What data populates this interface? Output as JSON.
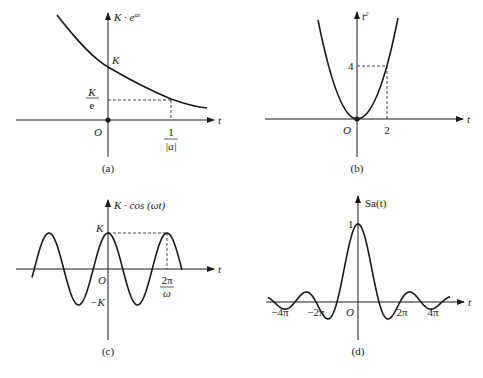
{
  "chart_data": [
    {
      "id": "a",
      "type": "line",
      "caption": "(a)",
      "ylabel": "K · e^{at}",
      "xlabel": "t",
      "function": "K·e^{at}, a<0",
      "origin_label": "O",
      "y_ticks": [
        {
          "label": "K",
          "meaning": "value at t=0"
        },
        {
          "label": "K/e",
          "meaning": "value at t=1/|a|"
        }
      ],
      "x_ticks": [
        {
          "label": "1/|a|"
        }
      ],
      "dashed_guides": [
        "horizontal at K/e",
        "vertical at 1/|a|"
      ],
      "points": [
        [
          -1.0,
          2.718
        ],
        [
          0,
          1.0
        ],
        [
          1.0,
          0.368
        ],
        [
          1.75,
          0.174
        ]
      ]
    },
    {
      "id": "b",
      "type": "line",
      "caption": "(b)",
      "ylabel": "t²",
      "xlabel": "t",
      "function": "t^2",
      "origin_label": "O",
      "x_ticks": [
        {
          "label": "2",
          "value": 2
        }
      ],
      "y_ticks": [
        {
          "label": "4",
          "value": 4
        }
      ],
      "dashed_guides": [
        "horizontal at 4",
        "vertical at 2"
      ],
      "points": [
        [
          -1.3,
          1.69
        ],
        [
          0,
          0
        ],
        [
          2,
          4
        ],
        [
          2.4,
          5.76
        ]
      ]
    },
    {
      "id": "c",
      "type": "line",
      "caption": "(c)",
      "ylabel": "K · cos(ωt)",
      "xlabel": "t",
      "function": "K·cos(ωt)",
      "origin_label": "O",
      "y_ticks": [
        {
          "label": "K"
        },
        {
          "label": "−K"
        }
      ],
      "x_ticks": [
        {
          "label": "2π/ω",
          "meaning": "one period"
        }
      ],
      "dashed_guides": [
        "horizontal at K",
        "vertical at 2π/ω"
      ],
      "x_range_periods": [
        -1.25,
        1.25
      ]
    },
    {
      "id": "d",
      "type": "line",
      "caption": "(d)",
      "ylabel": "Sa(t)",
      "xlabel": "t",
      "function": "Sa(t) = sin(t)/t",
      "origin_label": "O",
      "y_ticks": [
        {
          "label": "1",
          "value": 1
        }
      ],
      "x_ticks": [
        {
          "label": "−4π"
        },
        {
          "label": "−2π"
        },
        {
          "label": "2π"
        },
        {
          "label": "4π"
        }
      ]
    }
  ],
  "labels": {
    "a": {
      "ylabel_main": "K · e",
      "ylabel_sup": "at",
      "K": "K",
      "Ke_num": "K",
      "Ke_den": "e",
      "O": "O",
      "t": "t",
      "x_num": "1",
      "x_den": "|a|",
      "caption": "(a)"
    },
    "b": {
      "ylabel_main": "t",
      "ylabel_sup": "2",
      "four": "4",
      "two": "2",
      "O": "O",
      "t": "t",
      "caption": "(b)"
    },
    "c": {
      "ylabel": "K · cos (ωt)",
      "K": "K",
      "negK": "−K",
      "O": "O",
      "t": "t",
      "x_num": "2π",
      "x_den": "ω",
      "caption": "(c)"
    },
    "d": {
      "ylabel": "Sa(t)",
      "one": "1",
      "O": "O",
      "t": "t",
      "m4pi": "−4π",
      "m2pi": "−2π",
      "p2pi": "2π",
      "p4pi": "4π",
      "caption": "(d)"
    }
  }
}
